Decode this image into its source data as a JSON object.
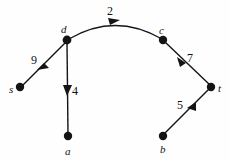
{
  "figure": {
    "name": "weighted-directed-graph",
    "background_color": "#fefefe",
    "stroke_color": "#141414",
    "width": 229,
    "height": 161
  },
  "graph": {
    "type": "directed-weighted-graph",
    "nodes": [
      {
        "id": "s",
        "label": "s",
        "x": 20,
        "y": 87,
        "label_x": 9,
        "label_y": 84
      },
      {
        "id": "d",
        "label": "d",
        "x": 67,
        "y": 40,
        "label_x": 61,
        "label_y": 24
      },
      {
        "id": "c",
        "label": "c",
        "x": 163,
        "y": 40,
        "label_x": 159,
        "label_y": 25
      },
      {
        "id": "t",
        "label": "t",
        "x": 211,
        "y": 87,
        "label_x": 218,
        "label_y": 83
      },
      {
        "id": "a",
        "label": "a",
        "x": 68,
        "y": 136,
        "label_x": 65,
        "label_y": 146
      },
      {
        "id": "b",
        "label": "b",
        "x": 163,
        "y": 136,
        "label_x": 160,
        "label_y": 144
      }
    ],
    "edges": [
      {
        "from": "s",
        "to": "d",
        "weight": "9",
        "label_x": 31,
        "label_y": 54,
        "shape": "straight"
      },
      {
        "from": "d",
        "to": "c",
        "weight": "2",
        "label_x": 107,
        "label_y": 5,
        "shape": "curved"
      },
      {
        "from": "d",
        "to": "a",
        "weight": "4",
        "label_x": 72,
        "label_y": 85,
        "shape": "straight"
      },
      {
        "from": "c",
        "to": "t",
        "weight": "7",
        "label_x": 187,
        "label_y": 52,
        "shape": "straight"
      },
      {
        "from": "b",
        "to": "t",
        "weight": "5",
        "label_x": 177,
        "label_y": 99,
        "shape": "straight"
      }
    ]
  }
}
